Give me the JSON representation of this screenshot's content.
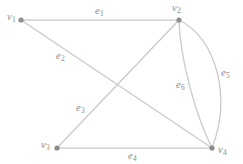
{
  "figure": {
    "type": "graph-diagram",
    "caption": "",
    "background_color": "#ffffff",
    "edge_color": "#c9c9c9",
    "vertex_color": "#8d8d8d",
    "label_color": "#8a8a8a"
  },
  "vertices": [
    {
      "id": "v1",
      "base": "v",
      "sub": "1",
      "x": 21,
      "y": 20,
      "label_x": 7,
      "label_y": 12
    },
    {
      "id": "v2",
      "base": "v",
      "sub": "2",
      "x": 179,
      "y": 20,
      "label_x": 172,
      "label_y": 3
    },
    {
      "id": "v3",
      "base": "v",
      "sub": "3",
      "x": 57,
      "y": 148,
      "label_x": 41,
      "label_y": 140
    },
    {
      "id": "v4",
      "base": "v",
      "sub": "4",
      "x": 212,
      "y": 148,
      "label_x": 218,
      "label_y": 145
    }
  ],
  "edges": [
    {
      "id": "e1",
      "base": "e",
      "sub": "1",
      "from": "v1",
      "to": "v2",
      "shape": "straight",
      "label_x": 95,
      "label_y": 6
    },
    {
      "id": "e2",
      "base": "e",
      "sub": "2",
      "from": "v1",
      "to": "v4",
      "shape": "straight",
      "label_x": 56,
      "label_y": 51
    },
    {
      "id": "e3",
      "base": "e",
      "sub": "3",
      "from": "v3",
      "to": "v2",
      "shape": "straight",
      "label_x": 76,
      "label_y": 103
    },
    {
      "id": "e4",
      "base": "e",
      "sub": "4",
      "from": "v3",
      "to": "v4",
      "shape": "straight",
      "label_x": 128,
      "label_y": 151
    },
    {
      "id": "e5",
      "base": "e",
      "sub": "5",
      "from": "v2",
      "to": "v4",
      "shape": "arc-right",
      "label_x": 221,
      "label_y": 68
    },
    {
      "id": "e6",
      "base": "e",
      "sub": "6",
      "from": "v2",
      "to": "v4",
      "shape": "arc-left",
      "label_x": 176,
      "label_y": 80
    }
  ]
}
